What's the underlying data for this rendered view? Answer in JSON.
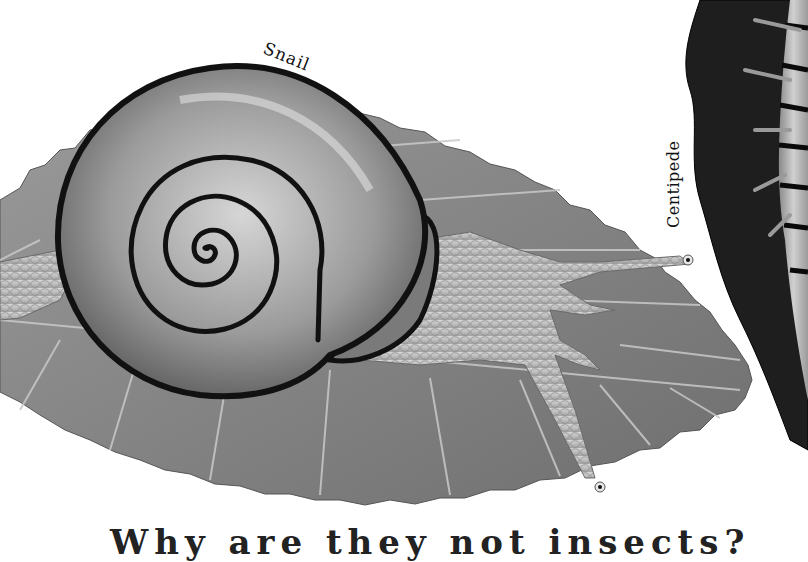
{
  "labels": {
    "snail": "Snail",
    "centipede": "Centipede"
  },
  "caption": "Why are they not insects?",
  "colors": {
    "background": "#ffffff",
    "leaf": "#8a8a8a",
    "leaf_vein": "#c8c8c8",
    "shell": "#9a9a9a",
    "shell_band": "#111111",
    "body": "#c4c4c4",
    "centipede_fur": "#1e1e1e",
    "centipede_segments": "#b0b0b0"
  }
}
